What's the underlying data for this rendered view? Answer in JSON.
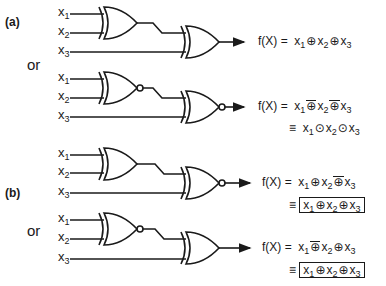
{
  "sections": [
    {
      "label": "(a)",
      "circuits": [
        {
          "inputs": [
            "x",
            "x",
            "x"
          ],
          "input_subs": [
            "1",
            "2",
            "3"
          ],
          "gate1": "XOR",
          "gate2": "XOR",
          "equations": [
            {
              "lhs": "f(X) =",
              "terms": [
                "x",
                "x",
                "x"
              ],
              "subs": [
                "1",
                "2",
                "3"
              ],
              "ops": [
                "⊕",
                "⊕"
              ],
              "ops_overbar": [
                false,
                false
              ],
              "overall_bar": false
            },
            null
          ]
        },
        {
          "inputs": [
            "x",
            "x",
            "x"
          ],
          "input_subs": [
            "1",
            "2",
            "3"
          ],
          "gate1": "XNOR",
          "gate2": "XNOR",
          "equations": [
            {
              "lhs": "f(X) =",
              "terms": [
                "x",
                "x",
                "x"
              ],
              "subs": [
                "1",
                "2",
                "3"
              ],
              "ops": [
                "⊙",
                "⊙"
              ],
              "ops_overbar": [
                true,
                true
              ],
              "overall_bar": false
            },
            {
              "lhs": "≡",
              "terms": [
                "x",
                "x",
                "x"
              ],
              "subs": [
                "1",
                "2",
                "3"
              ],
              "ops": [
                "⊙",
                "⊙"
              ],
              "ops_overbar": [
                false,
                false
              ],
              "overall_bar": false
            }
          ]
        }
      ]
    },
    {
      "label": "(b)",
      "circuits": [
        {
          "inputs": [
            "x",
            "x",
            "x"
          ],
          "input_subs": [
            "1",
            "2",
            "3"
          ],
          "gate1": "XOR",
          "gate2": "XNOR",
          "equations": [
            {
              "lhs": "f(X) =",
              "terms": [
                "x",
                "x",
                "x"
              ],
              "subs": [
                "1",
                "2",
                "3"
              ],
              "ops": [
                "⊕",
                "⊙"
              ],
              "ops_overbar": [
                false,
                true
              ],
              "overall_bar": false
            },
            {
              "lhs": "≡",
              "terms": [
                "x",
                "x",
                "x"
              ],
              "subs": [
                "1",
                "2",
                "3"
              ],
              "ops": [
                "⊕",
                "⊕"
              ],
              "ops_overbar": [
                false,
                false
              ],
              "overall_bar": true
            }
          ]
        },
        {
          "inputs": [
            "x",
            "x",
            "x"
          ],
          "input_subs": [
            "1",
            "2",
            "3"
          ],
          "gate1": "XNOR",
          "gate2": "XOR",
          "equations": [
            {
              "lhs": "f(X) =",
              "terms": [
                "x",
                "x",
                "x"
              ],
              "subs": [
                "1",
                "2",
                "3"
              ],
              "ops": [
                "⊙",
                "⊕"
              ],
              "ops_overbar": [
                true,
                false
              ],
              "overall_bar": false
            },
            {
              "lhs": "≡",
              "terms": [
                "x",
                "x",
                "x"
              ],
              "subs": [
                "1",
                "2",
                "3"
              ],
              "ops": [
                "⊕",
                "⊕"
              ],
              "ops_overbar": [
                false,
                false
              ],
              "overall_bar": true
            }
          ]
        }
      ]
    }
  ],
  "or_label": "or",
  "text": {
    "a_label": "(a)",
    "b_label": "(b)",
    "or1": "or",
    "or2": "or",
    "x": "x",
    "s1": "1",
    "s2": "2",
    "s3": "3",
    "fx": "f(X) =",
    "equiv": "≡",
    "xor": "⊕",
    "xnor": "⊙"
  }
}
